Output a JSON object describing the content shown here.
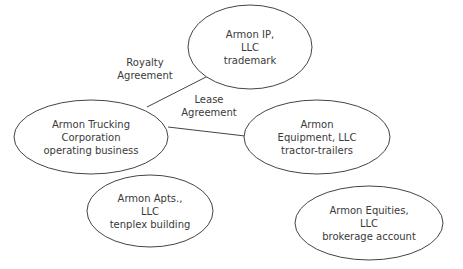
{
  "diagram": {
    "type": "entity-relationship",
    "nodes": [
      {
        "id": "ip",
        "lines": [
          "Armon IP,",
          "LLC",
          "trademark"
        ],
        "cx": 250,
        "cy": 47,
        "rx": 62,
        "ry": 42
      },
      {
        "id": "trucking",
        "lines": [
          "Armon Trucking",
          "Corporation",
          "operating business"
        ],
        "cx": 91,
        "cy": 137,
        "rx": 77,
        "ry": 37
      },
      {
        "id": "equipment",
        "lines": [
          "Armon",
          "Equipment, LLC",
          "tractor-trailers"
        ],
        "cx": 317,
        "cy": 137,
        "rx": 73,
        "ry": 37
      },
      {
        "id": "apts",
        "lines": [
          "Armon Apts.,",
          "LLC",
          "tenplex building"
        ],
        "cx": 150,
        "cy": 211,
        "rx": 63,
        "ry": 36
      },
      {
        "id": "equities",
        "lines": [
          "Armon Equities,",
          "LLC",
          "brokerage account"
        ],
        "cx": 369,
        "cy": 223,
        "rx": 74,
        "ry": 37
      }
    ],
    "edges": [
      {
        "from": "trucking",
        "to": "ip",
        "label_lines": [
          "Royalty",
          "Agreement"
        ],
        "x1": 147,
        "y1": 107,
        "x2": 208,
        "y2": 76,
        "label_x": 145,
        "label_y": 66
      },
      {
        "from": "trucking",
        "to": "equipment",
        "label_lines": [
          "Lease",
          "Agreement"
        ],
        "x1": 168,
        "y1": 127,
        "x2": 245,
        "y2": 136,
        "label_x": 209,
        "label_y": 103
      }
    ],
    "colors": {
      "stroke": "#444444",
      "text": "#3a3a3a",
      "background": "#ffffff"
    }
  }
}
